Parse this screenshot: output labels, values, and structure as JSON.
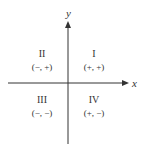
{
  "diagram": {
    "type": "coordinate-plane-quadrants",
    "axes": {
      "x_label": "x",
      "y_label": "y",
      "color": "#333333"
    },
    "quadrants": [
      {
        "numeral": "I",
        "signs": "(+, +)",
        "position": "upper-right"
      },
      {
        "numeral": "II",
        "signs": "(−, +)",
        "position": "upper-left"
      },
      {
        "numeral": "III",
        "signs": "(−, −)",
        "position": "lower-left"
      },
      {
        "numeral": "IV",
        "signs": "(+, −)",
        "position": "lower-right"
      }
    ]
  }
}
